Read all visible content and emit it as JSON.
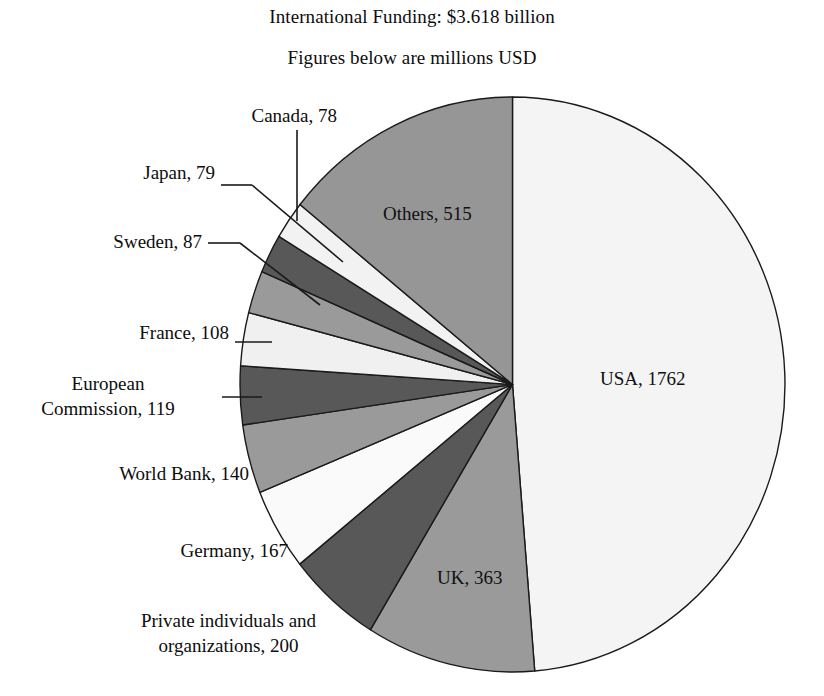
{
  "chart_data": {
    "type": "pie",
    "title": "International Funding: $3.618 billion",
    "subtitle": "Figures below are millions USD",
    "units": "millions USD",
    "total": 3618,
    "categories": [
      "USA",
      "UK",
      "Private individuals and organizations",
      "Germany",
      "World Bank",
      "European Commission",
      "France",
      "Sweden",
      "Japan",
      "Canada",
      "Others"
    ],
    "values": [
      1762,
      363,
      200,
      167,
      140,
      119,
      108,
      87,
      79,
      78,
      515
    ],
    "labels": [
      "USA, 1762",
      "UK, 363",
      "Private individuals and organizations, 200",
      "Germany, 167",
      "World Bank, 140",
      "European Commission, 119",
      "France, 108",
      "Sweden, 87",
      "Japan, 79",
      "Canada, 78",
      "Others, 515"
    ],
    "slice_colors": [
      "#f4f4f4",
      "#9a9a9a",
      "#585858",
      "#fafafa",
      "#9a9a9a",
      "#585858",
      "#f0f0f0",
      "#9a9a9a",
      "#585858",
      "#f2f2f2",
      "#969696"
    ],
    "legend": "none",
    "grid": false,
    "start_angle_deg": 0,
    "direction": "clockwise"
  },
  "titles": {
    "main": "International Funding: $3.618 billion",
    "sub": "Figures below are millions USD"
  },
  "inside_labels": [
    {
      "text": "USA, 1762"
    },
    {
      "text": "UK, 363"
    },
    {
      "text": "Others, 515"
    }
  ],
  "callout_labels": [
    {
      "text": "Canada, 78"
    },
    {
      "text": "Japan, 79"
    },
    {
      "text": "Sweden, 87"
    },
    {
      "text": "France, 108"
    },
    {
      "text": "European",
      "text2": "Commission, 119"
    },
    {
      "text": "World Bank, 140"
    },
    {
      "text": "Germany, 167"
    },
    {
      "text": "Private individuals and",
      "text2": "organizations, 200"
    }
  ],
  "colors": {
    "outline": "#1a1a1a",
    "leader": "#1a1a1a",
    "text": "#0d0d0d",
    "background": "#ffffff"
  }
}
